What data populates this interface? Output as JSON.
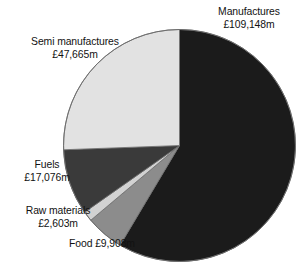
{
  "chart_data": {
    "type": "pie",
    "title": "",
    "subtitle": "",
    "xlabel": "",
    "ylabel": "",
    "units": "£m",
    "currency_symbol": "£",
    "unit_suffix": "m",
    "total": 186400,
    "legend_position": "none",
    "labels_inline": true,
    "grid": false,
    "start_angle_deg": 0,
    "direction": "clockwise",
    "categories": [
      "Manufactures",
      "Semi manufactures",
      "Fuels",
      "Raw materials",
      "Food"
    ],
    "values": [
      109148,
      47665,
      17076,
      2603,
      9908
    ],
    "slices": [
      {
        "name": "Manufactures",
        "value": 109148,
        "value_text": "£109,148m",
        "label_line1": "Manufactures",
        "label_line2": "£109,148m",
        "percent": 58.6,
        "angle_deg": 210.8,
        "start_deg": 0,
        "end_deg": 210.8,
        "color": "#1b1b1b"
      },
      {
        "name": "Semi manufactures",
        "value": 47665,
        "value_text": "£47,665m",
        "label_line1": "Semi manufactures",
        "label_line2": "£47,665m",
        "percent": 25.6,
        "angle_deg": 92.1,
        "start_deg": 267.9,
        "end_deg": 360.0,
        "color": "#e2e2e2"
      },
      {
        "name": "Fuels",
        "value": 17076,
        "value_text": "£17,076m",
        "label_line1": "Fuels",
        "label_line2": "£17,076m",
        "percent": 9.2,
        "angle_deg": 33.0,
        "start_deg": 234.9,
        "end_deg": 267.9,
        "color": "#3a3a3a"
      },
      {
        "name": "Raw materials",
        "value": 2603,
        "value_text": "£2,603m",
        "label_line1": "Raw materials",
        "label_line2": "£2,603m",
        "percent": 1.4,
        "angle_deg": 5.0,
        "start_deg": 229.9,
        "end_deg": 234.9,
        "color": "#d2d2d2"
      },
      {
        "name": "Food",
        "value": 9908,
        "value_text": "£9,908m",
        "label_line1": "Food £9,908m",
        "label_line2": "",
        "percent": 5.3,
        "angle_deg": 19.1,
        "start_deg": 210.8,
        "end_deg": 229.9,
        "color": "#8c8c8c"
      }
    ],
    "geometry": {
      "center_x": 179.5,
      "center_y": 145.5,
      "radius": 116
    },
    "colors": {
      "background": "#ffffff",
      "outline": "#6b6b6b",
      "text": "#121212"
    }
  }
}
